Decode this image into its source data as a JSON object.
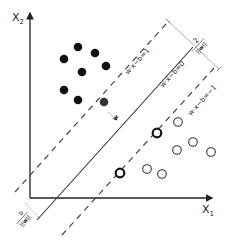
{
  "diagram": {
    "axes": {
      "x_label": "X",
      "x_sub": "1",
      "y_label": "X",
      "y_sub": "2",
      "color": "#222222"
    },
    "lines": {
      "upper_margin": {
        "label": "w·x−b=1",
        "style": "dashed"
      },
      "hyperplane": {
        "label": "w·x−b=0",
        "style": "solid"
      },
      "lower_margin": {
        "label": "w·x−b=−1",
        "style": "dashed"
      }
    },
    "annotations": {
      "margin_width": {
        "numerator": "2",
        "denominator": "||w||"
      },
      "offset": {
        "numerator": "b",
        "denominator": "||w||"
      },
      "normal_vector": "w"
    },
    "class_positive": {
      "marker": "filled-circle",
      "color": "#111111",
      "points": [
        [
          78,
          47
        ],
        [
          95,
          53
        ],
        [
          64,
          59
        ],
        [
          106,
          66
        ],
        [
          82,
          72
        ],
        [
          64,
          90
        ],
        [
          78,
          100
        ]
      ],
      "support_vectors": [
        [
          104,
          102
        ]
      ]
    },
    "class_negative": {
      "marker": "open-circle",
      "color": "#333333",
      "points": [
        [
          178,
          122
        ],
        [
          193,
          142
        ],
        [
          177,
          150
        ],
        [
          211,
          152
        ],
        [
          147,
          169
        ],
        [
          162,
          174
        ]
      ],
      "support_vectors": [
        [
          157,
          133
        ],
        [
          120,
          173
        ]
      ]
    }
  }
}
